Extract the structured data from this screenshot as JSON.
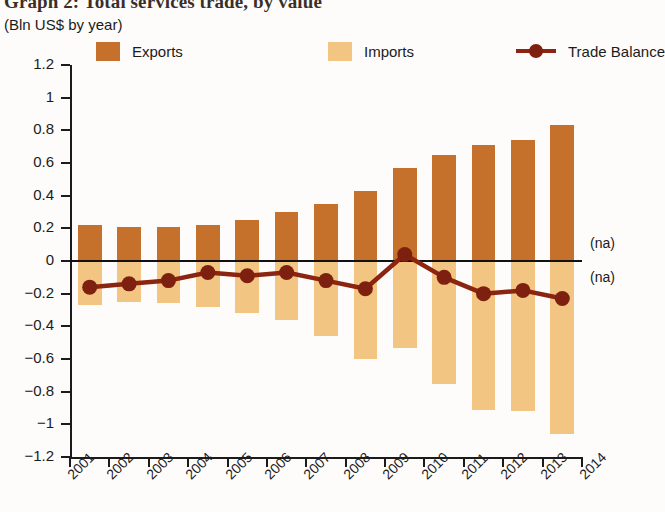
{
  "title": {
    "main": "Graph 2: Total services trade, by value",
    "sub": "(Bln US$ by year)"
  },
  "legend": [
    {
      "label": "Exports",
      "marker": "square-swatch",
      "color": "#C5702B"
    },
    {
      "label": "Imports",
      "marker": "square-swatch",
      "color": "#F3C583"
    },
    {
      "label": "Trade Balance",
      "marker": "line-with-dot",
      "color": "#8B2410"
    }
  ],
  "annotations": [
    {
      "text": "(na)",
      "position": "above-zero-right"
    },
    {
      "text": "(na)",
      "position": "below-zero-right"
    }
  ],
  "chart_data": {
    "type": "bar",
    "title": "Graph 2: Total services trade, by value",
    "subtitle": "(Bln US$ by year)",
    "xlabel": "",
    "ylabel": "Bln US$",
    "ylim": [
      -1.2,
      1.2
    ],
    "ytick_labels": [
      "1.2",
      "1",
      "0.8",
      "0.6",
      "0.4",
      "0.2",
      "0",
      "-0.2",
      "-0.4",
      "-0.6",
      "-0.8",
      "-1",
      "-1.2"
    ],
    "ytick_values": [
      1.2,
      1,
      0.8,
      0.6,
      0.4,
      0.2,
      0,
      -0.2,
      -0.4,
      -0.6,
      -0.8,
      -1,
      -1.2
    ],
    "xtick_labels": [
      "2001",
      "2002",
      "2003",
      "2004",
      "2005",
      "2006",
      "2007",
      "2008",
      "2009",
      "2010",
      "2011",
      "2012",
      "2013",
      "2014"
    ],
    "categories": [
      "2001",
      "2002",
      "2003",
      "2004",
      "2005",
      "2006",
      "2007",
      "2008",
      "2009",
      "2010",
      "2011",
      "2012",
      "2013"
    ],
    "grid": false,
    "legend_position": "top",
    "series": [
      {
        "name": "Exports",
        "type": "bar",
        "color": "#C5702B",
        "values": [
          0.22,
          0.21,
          0.21,
          0.22,
          0.25,
          0.3,
          0.35,
          0.43,
          0.57,
          0.65,
          0.71,
          0.74,
          0.83
        ]
      },
      {
        "name": "Imports",
        "type": "bar",
        "color": "#F3C583",
        "values": [
          -0.27,
          -0.25,
          -0.26,
          -0.28,
          -0.32,
          -0.36,
          -0.46,
          -0.6,
          -0.53,
          -0.75,
          -0.91,
          -0.92,
          -1.06
        ]
      },
      {
        "name": "Trade Balance",
        "type": "line",
        "color": "#8B2410",
        "values": [
          -0.16,
          -0.14,
          -0.12,
          -0.07,
          -0.09,
          -0.07,
          -0.12,
          -0.17,
          0.04,
          -0.1,
          -0.2,
          -0.18,
          -0.23
        ]
      }
    ]
  }
}
